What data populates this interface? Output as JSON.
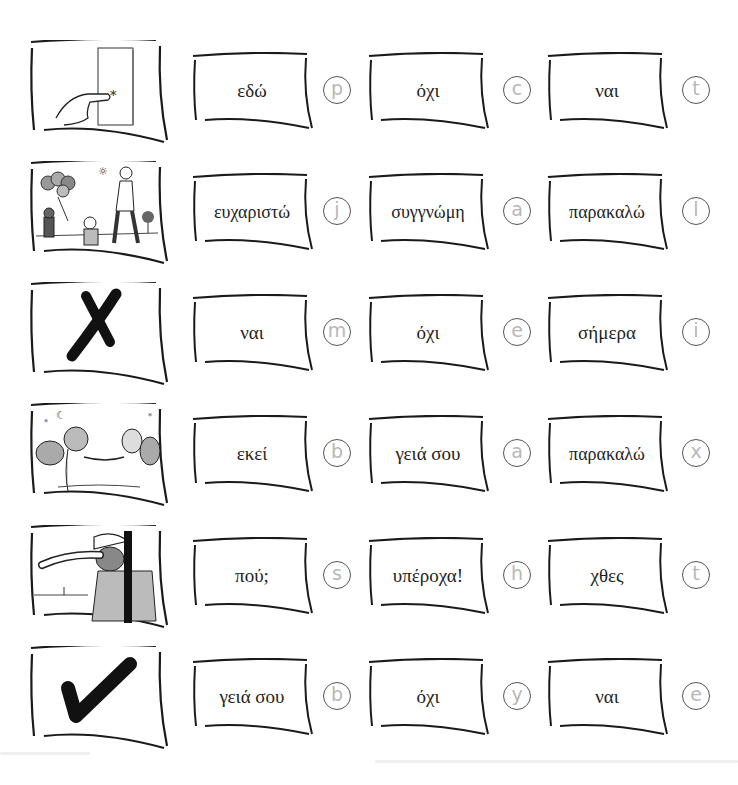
{
  "exercise": {
    "rows": [
      {
        "picture": "finger-pointing-at-door",
        "options": [
          {
            "word": "εδώ",
            "letter": "p"
          },
          {
            "word": "όχι",
            "letter": "c"
          },
          {
            "word": "ναι",
            "letter": "t"
          }
        ]
      },
      {
        "picture": "man-giving-balloons-to-children",
        "options": [
          {
            "word": "ευχαριστώ",
            "letter": "j"
          },
          {
            "word": "συγγνώμη",
            "letter": "a"
          },
          {
            "word": "παρακαλώ",
            "letter": "l"
          }
        ]
      },
      {
        "picture": "cross-mark",
        "options": [
          {
            "word": "ναι",
            "letter": "m"
          },
          {
            "word": "όχι",
            "letter": "e"
          },
          {
            "word": "σήμερα",
            "letter": "i"
          }
        ]
      },
      {
        "picture": "two-aliens-shaking-hands",
        "options": [
          {
            "word": "εκεί",
            "letter": "b"
          },
          {
            "word": "γειά σου",
            "letter": "a"
          },
          {
            "word": "παρακαλώ",
            "letter": "x"
          }
        ]
      },
      {
        "picture": "explorer-looking-into-distance",
        "options": [
          {
            "word": "πού;",
            "letter": "s"
          },
          {
            "word": "υπέροχα!",
            "letter": "h"
          },
          {
            "word": "χθες",
            "letter": "t"
          }
        ]
      },
      {
        "picture": "check-mark",
        "options": [
          {
            "word": "γειά σου",
            "letter": "b"
          },
          {
            "word": "όχι",
            "letter": "y"
          },
          {
            "word": "ναι",
            "letter": "e"
          }
        ]
      }
    ]
  },
  "colors": {
    "ink": "#1a1a1a",
    "letter": "#b8b8b8",
    "circle_border": "#555555",
    "background": "#ffffff"
  }
}
